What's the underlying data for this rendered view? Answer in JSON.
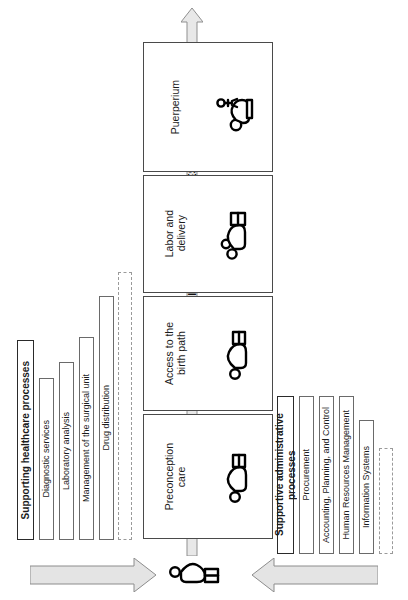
{
  "diagram": {
    "orientation": "rotated-90",
    "core_arrow": {
      "label": "PRIMARY CLINICAL-CARE PROCESSES",
      "direction": "up",
      "color": "#e8e8e8"
    },
    "clinical_processes": [
      {
        "label": "Preconception\ncare",
        "icon": "pregnant-woman-icon"
      },
      {
        "label": "Access to the\nbirth path",
        "icon": "pregnant-woman-icon"
      },
      {
        "label": "Labor and\ndelivery",
        "icon": "woman-in-labor-bed-icon"
      },
      {
        "label": "Puerperium",
        "icon": "mother-and-baby-icon"
      }
    ],
    "supporting_healthcare": {
      "header": "Supporting healthcare processes",
      "items": [
        "Diagnostic services",
        "Laboratory analysis",
        "Management of the surgical unit",
        "Drug distribution",
        ""
      ]
    },
    "supportive_administrative": {
      "header": "Supportive administrative processes",
      "items": [
        "Procurement",
        "Accounting, Planning, and Control",
        "Human Resources Management",
        "Information Systems",
        ""
      ]
    },
    "bottom": {
      "left_arrow": "inbound-arrow",
      "right_arrow": "inbound-arrow",
      "center_icon": "pregnant-woman-icon",
      "arrow_color": "#e4e4e4"
    },
    "colors": {
      "arrow_fill": "#e8e8e8",
      "arrow_stroke": "#8c8c8c",
      "box_stroke": "#4a4a4a",
      "text": "#1b1b1b"
    }
  }
}
